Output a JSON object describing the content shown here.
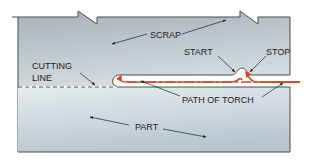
{
  "diagram": {
    "type": "oxyfuel cutting torch path illustration",
    "labels": {
      "scrap": "SCRAP",
      "start": "START",
      "stop": "STOP",
      "cutting_line_1": "CUTTING",
      "cutting_line_2": "LINE",
      "path_of_torch": "PATH OF TORCH",
      "part": "PART"
    },
    "colors": {
      "plate_fill_top": "#a9b3bb",
      "plate_fill_bottom": "#dde5ea",
      "outline": "#4a4a4a",
      "torch_path": "#e0452a",
      "text": "#222222"
    }
  }
}
